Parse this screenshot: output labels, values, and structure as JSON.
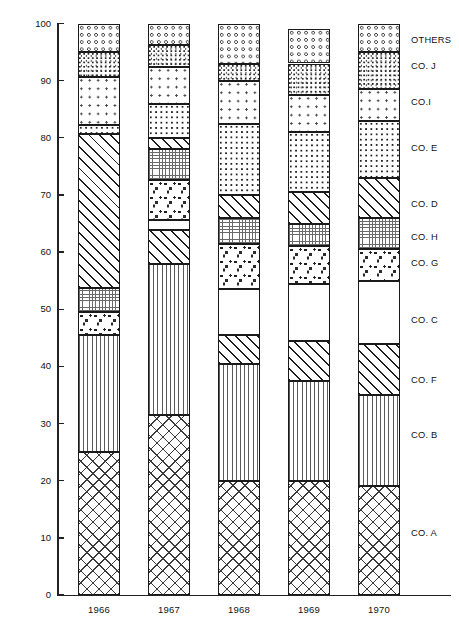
{
  "chart_data": {
    "type": "bar",
    "subtype": "stacked-vertical-100-percent",
    "title": "",
    "xlabel": "",
    "ylabel": "",
    "ylim": [
      0,
      100
    ],
    "yticks": [
      0,
      10,
      20,
      30,
      40,
      50,
      60,
      70,
      80,
      90,
      100
    ],
    "grid": false,
    "legend_position": "right",
    "categories": [
      "1966",
      "1967",
      "1968",
      "1969",
      "1970"
    ],
    "stack_order_bottom_to_top": [
      "CO. A",
      "CO. B",
      "CO. F",
      "CO. C",
      "CO. G",
      "CO. H",
      "CO. D",
      "CO. E",
      "CO.I",
      "CO. J",
      "OTHERS"
    ],
    "series": [
      {
        "name": "CO. A",
        "pattern": "diamond-crosshatch",
        "values": [
          25.0,
          31.5,
          20.0,
          20.0,
          19.0
        ]
      },
      {
        "name": "CO. B",
        "pattern": "vertical-lines",
        "values": [
          20.5,
          26.5,
          20.5,
          17.5,
          16.0
        ]
      },
      {
        "name": "CO. F",
        "pattern": "diagonal-hatch",
        "values": [
          0.0,
          5.8,
          5.0,
          7.0,
          9.0
        ]
      },
      {
        "name": "CO. C",
        "pattern": "blank",
        "values": [
          0.0,
          1.8,
          8.0,
          10.0,
          11.0
        ]
      },
      {
        "name": "CO. G",
        "pattern": "triangle-stipple",
        "values": [
          4.0,
          7.0,
          8.0,
          6.5,
          5.5
        ]
      },
      {
        "name": "CO. H",
        "pattern": "fine-grid",
        "values": [
          4.2,
          5.5,
          4.5,
          4.0,
          5.5
        ]
      },
      {
        "name": "CO. D",
        "pattern": "diagonal-hatch",
        "values": [
          27.0,
          1.8,
          4.0,
          5.5,
          7.0
        ]
      },
      {
        "name": "CO. E",
        "pattern": "square-dot-grid",
        "values": [
          1.5,
          6.0,
          12.5,
          10.5,
          10.0
        ]
      },
      {
        "name": "CO.I",
        "pattern": "light-stipple",
        "values": [
          8.5,
          6.5,
          7.5,
          6.5,
          5.5
        ]
      },
      {
        "name": "CO. J",
        "pattern": "dark-speckle",
        "values": [
          4.3,
          3.8,
          3.0,
          5.5,
          6.5
        ]
      },
      {
        "name": "OTHERS",
        "pattern": "open-ring-dots",
        "values": [
          5.0,
          3.8,
          7.0,
          6.0,
          5.0
        ]
      }
    ],
    "legend_entries": [
      "OTHERS",
      "CO. J",
      "CO.I",
      "CO. E",
      "CO. D",
      "CO. H",
      "CO. G",
      "CO. C",
      "CO. F",
      "CO. B",
      "CO. A"
    ]
  },
  "axis": {
    "y_tick_labels": [
      "100",
      "90",
      "80",
      "70",
      "60",
      "50",
      "40",
      "30",
      "20",
      "10",
      "0"
    ],
    "x_tick_labels": [
      "1966",
      "1967",
      "1968",
      "1969",
      "1970"
    ]
  },
  "legend": {
    "items": [
      {
        "label": "OTHERS",
        "top": 35
      },
      {
        "label": "CO. J",
        "top": 61
      },
      {
        "label": "CO.I",
        "top": 97
      },
      {
        "label": "CO. E",
        "top": 143
      },
      {
        "label": "CO. D",
        "top": 199
      },
      {
        "label": "CO. H",
        "top": 232
      },
      {
        "label": "CO. G",
        "top": 258
      },
      {
        "label": "CO. C",
        "top": 315
      },
      {
        "label": "CO. F",
        "top": 375
      },
      {
        "label": "CO. B",
        "top": 430
      },
      {
        "label": "CO. A",
        "top": 528
      }
    ]
  },
  "colors": {
    "ink": "#1a1a1a",
    "background": "#ffffff"
  }
}
